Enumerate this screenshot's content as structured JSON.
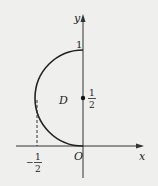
{
  "figure": {
    "axis_x_label": "x",
    "axis_y_label": "y",
    "origin_label": "O",
    "region_label": "D",
    "y_tick_top": "1",
    "y_tick_mid_num": "1",
    "y_tick_mid_den": "2",
    "x_tick_neg_sign": "−",
    "x_tick_num": "1",
    "x_tick_den": "2"
  }
}
